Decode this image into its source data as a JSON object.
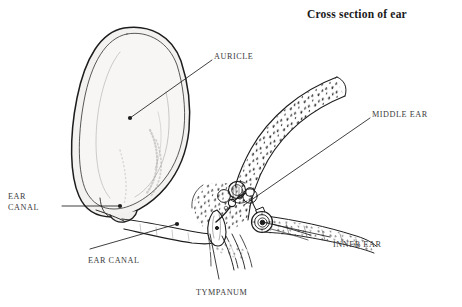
{
  "figure": {
    "title": "Cross section of ear",
    "type": "anatomical-line-diagram",
    "background_color": "#ffffff",
    "ink_color": "#1a1a1a",
    "label_color": "#3a3a3a",
    "auricle_fill": "#f2f1ef",
    "bone_fill": "#ffffff",
    "labels": [
      {
        "id": "auricle",
        "text": "AURICLE",
        "x": 214,
        "y": 52,
        "align": "left",
        "lines": [
          "AURICLE"
        ]
      },
      {
        "id": "middle-ear",
        "text": "MIDDLE EAR",
        "x": 372,
        "y": 110,
        "align": "left",
        "lines": [
          "MIDDLE EAR"
        ]
      },
      {
        "id": "inner-ear",
        "text": "INNER EAR",
        "x": 333,
        "y": 240,
        "align": "left",
        "lines": [
          "INNER EAR"
        ]
      },
      {
        "id": "ear-canal-left",
        "text": "EAR CANAL",
        "x": 8,
        "y": 192,
        "align": "left",
        "lines": [
          "EAR",
          "CANAL"
        ]
      },
      {
        "id": "ear-canal-bottom",
        "text": "EAR CANAL",
        "x": 88,
        "y": 256,
        "align": "left",
        "lines": [
          "EAR CANAL"
        ]
      },
      {
        "id": "tympanum",
        "text": "TYMPANUM",
        "x": 196,
        "y": 288,
        "align": "left",
        "lines": [
          "TYMPANUM"
        ]
      }
    ],
    "leaders": [
      {
        "id": "auricle",
        "from": [
          212,
          60
        ],
        "to": [
          130,
          118
        ],
        "dot_at": "to"
      },
      {
        "id": "middle-ear",
        "from": [
          370,
          118
        ],
        "to": [
          244,
          205
        ],
        "dot_at": "none"
      },
      {
        "id": "inner-ear",
        "from": [
          330,
          237
        ],
        "to": [
          262,
          222
        ],
        "dot_at": "none"
      },
      {
        "id": "ear-canal-left",
        "from": [
          62,
          206
        ],
        "to": [
          120,
          206
        ],
        "dot_at": "to"
      },
      {
        "id": "ear-canal-bottom",
        "from": [
          88,
          249
        ],
        "to": [
          177,
          224
        ],
        "dot_at": "to"
      },
      {
        "id": "tympanum",
        "from": [
          219,
          279
        ],
        "to": [
          209,
          232
        ],
        "dot_at": "none"
      }
    ]
  }
}
